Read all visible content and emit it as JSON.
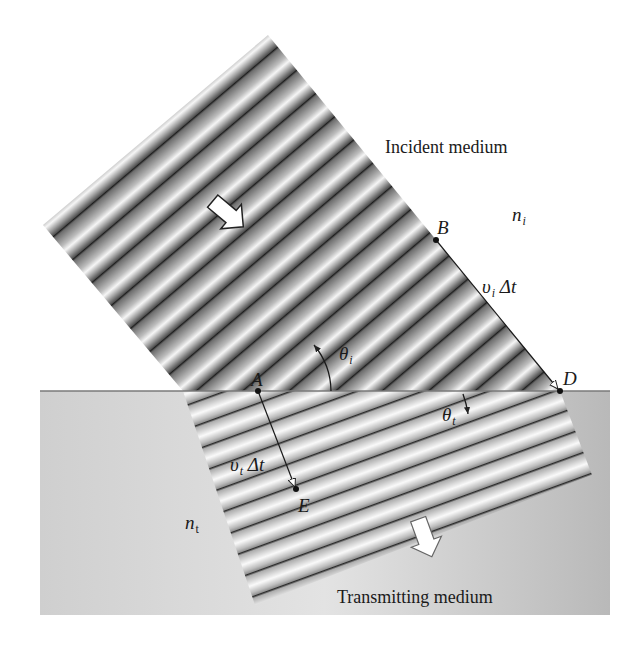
{
  "figure": {
    "type": "refraction-wavefront-diagram",
    "colors": {
      "background": "#ffffff",
      "transmitting_medium": "#c8c8c8",
      "interface_line": "#7a7a7a",
      "wave_dark": "#3a3a3a",
      "wave_light": "#f4f4f4",
      "arrow_fill": "#ffffff",
      "arrow_stroke": "#222222"
    }
  },
  "labels": {
    "incident_medium": "Incident medium",
    "transmitting_medium": "Transmitting medium",
    "n_i": {
      "base": "n",
      "sub": "i"
    },
    "n_t": {
      "base": "n",
      "sub": "t"
    },
    "point_A": "A",
    "point_B": "B",
    "point_D": "D",
    "point_E": "E",
    "theta_i": {
      "base": "θ",
      "sub": "i"
    },
    "theta_t": {
      "base": "θ",
      "sub": "t"
    },
    "vi_dt": {
      "v": "υ",
      "sub": "i",
      "rest": " Δt"
    },
    "vt_dt": {
      "v": "υ",
      "sub": "t",
      "rest": " Δt"
    }
  },
  "points": {
    "A": [
      258,
      391
    ],
    "B": [
      436,
      240
    ],
    "D": [
      560,
      391
    ],
    "E": [
      296,
      489
    ]
  }
}
